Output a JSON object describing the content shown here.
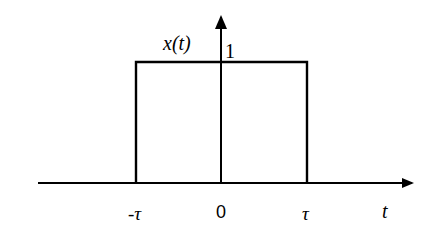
{
  "diagram": {
    "function_label": "x(t)",
    "amplitude_label": "1",
    "x_axis_label": "t",
    "tick_labels": {
      "neg_tau": "-τ",
      "origin": "0",
      "pos_tau": "τ"
    },
    "pulse": {
      "start": "-τ",
      "end": "τ",
      "height": 1
    },
    "colors": {
      "stroke": "#000000",
      "background": "#ffffff"
    }
  }
}
